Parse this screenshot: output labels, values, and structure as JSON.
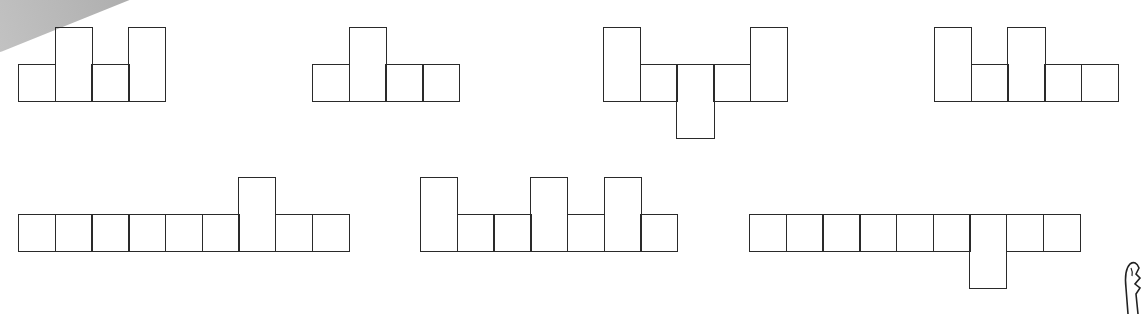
{
  "cell_size": 36.7,
  "stroke_color": "#2a2a2a",
  "figures": [
    {
      "name": "figure-1",
      "x": 18,
      "base_y": 64,
      "cells": [
        "up0",
        "up1",
        "up0",
        "up1"
      ]
    },
    {
      "name": "figure-2",
      "x": 312,
      "base_y": 64,
      "cells": [
        "up0",
        "up1",
        "up0",
        "up0"
      ]
    },
    {
      "name": "figure-3",
      "x": 603,
      "base_y": 64,
      "cells": [
        "up1",
        "up0",
        "down1",
        "up0",
        "up1"
      ]
    },
    {
      "name": "figure-4",
      "x": 934,
      "base_y": 64,
      "cells": [
        "up1",
        "up0",
        "up1",
        "up0",
        "up0"
      ]
    },
    {
      "name": "figure-5",
      "x": 18,
      "base_y": 214,
      "cells": [
        "up0",
        "up0",
        "up0",
        "up0",
        "up0",
        "up0",
        "up1",
        "up0",
        "up0"
      ]
    },
    {
      "name": "figure-6",
      "x": 420,
      "base_y": 214,
      "cells": [
        "up1",
        "up0",
        "up0",
        "up1",
        "up0",
        "up1",
        "up0"
      ]
    },
    {
      "name": "figure-7",
      "x": 749,
      "base_y": 214,
      "cells": [
        "up0",
        "up0",
        "up0",
        "up0",
        "up0",
        "up0",
        "down1",
        "up0",
        "up0"
      ]
    }
  ]
}
